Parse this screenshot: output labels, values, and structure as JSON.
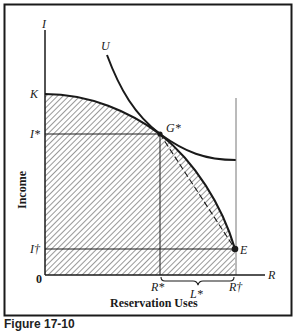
{
  "figure": {
    "caption": "Figure 17-10",
    "axis_labels": {
      "y_axis_symbol": "I",
      "x_axis_symbol": "R",
      "y_axis_title": "Income",
      "x_axis_title": "Reservation Uses",
      "origin": "0"
    },
    "y_ticks": {
      "K": "K",
      "I_star": "I*",
      "I_dagger": "I†"
    },
    "x_ticks": {
      "R_star": "R*",
      "L_star": "L*",
      "R_dagger": "R†"
    },
    "points": {
      "G_star": "G*",
      "E": "E"
    },
    "curves": {
      "indifference_curve": "U"
    },
    "colors": {
      "line": "#1a1a1a",
      "hatch": "#333333",
      "background": "#ffffff",
      "thin_line": "#777777"
    }
  }
}
